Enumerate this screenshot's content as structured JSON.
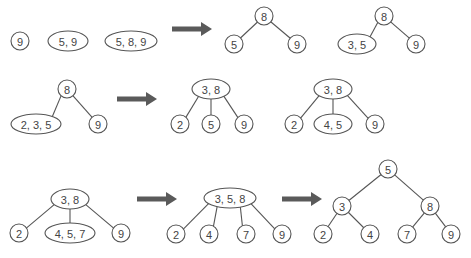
{
  "diagram": {
    "colors": {
      "stroke": "#555555",
      "text": "#444444",
      "arrow": "#5a5a5a",
      "background": "#ffffff"
    },
    "nodes": [
      {
        "id": "r1_a",
        "label": "9",
        "shape": "circle",
        "cx": 20,
        "cy": 41,
        "rx": 9,
        "ry": 9
      },
      {
        "id": "r1_b",
        "label": "5, 9",
        "shape": "ellipse",
        "cx": 68,
        "cy": 41,
        "rx": 20,
        "ry": 10
      },
      {
        "id": "r1_c",
        "label": "5, 8, 9",
        "shape": "ellipse",
        "cx": 131,
        "cy": 41,
        "rx": 26,
        "ry": 10
      },
      {
        "id": "r1_t1_root",
        "label": "8",
        "shape": "circle",
        "cx": 264,
        "cy": 16,
        "rx": 9,
        "ry": 9
      },
      {
        "id": "r1_t1_l",
        "label": "5",
        "shape": "circle",
        "cx": 234,
        "cy": 44,
        "rx": 9,
        "ry": 9
      },
      {
        "id": "r1_t1_r",
        "label": "9",
        "shape": "circle",
        "cx": 297,
        "cy": 44,
        "rx": 9,
        "ry": 9
      },
      {
        "id": "r1_t2_root",
        "label": "8",
        "shape": "circle",
        "cx": 384,
        "cy": 16,
        "rx": 9,
        "ry": 9
      },
      {
        "id": "r1_t2_l",
        "label": "3, 5",
        "shape": "ellipse",
        "cx": 357,
        "cy": 44,
        "rx": 19,
        "ry": 10
      },
      {
        "id": "r1_t2_r",
        "label": "9",
        "shape": "circle",
        "cx": 416,
        "cy": 44,
        "rx": 9,
        "ry": 9
      },
      {
        "id": "r2_t1_root",
        "label": "8",
        "shape": "circle",
        "cx": 67,
        "cy": 89,
        "rx": 9,
        "ry": 9
      },
      {
        "id": "r2_t1_l",
        "label": "2, 3, 5",
        "shape": "ellipse",
        "cx": 36,
        "cy": 124,
        "rx": 25,
        "ry": 10
      },
      {
        "id": "r2_t1_r",
        "label": "9",
        "shape": "circle",
        "cx": 98,
        "cy": 124,
        "rx": 9,
        "ry": 9
      },
      {
        "id": "r2_t2_root",
        "label": "3, 8",
        "shape": "ellipse",
        "cx": 211,
        "cy": 89,
        "rx": 19,
        "ry": 10
      },
      {
        "id": "r2_t2_a",
        "label": "2",
        "shape": "circle",
        "cx": 180,
        "cy": 124,
        "rx": 9,
        "ry": 9
      },
      {
        "id": "r2_t2_b",
        "label": "5",
        "shape": "circle",
        "cx": 211,
        "cy": 124,
        "rx": 9,
        "ry": 9
      },
      {
        "id": "r2_t2_c",
        "label": "9",
        "shape": "circle",
        "cx": 244,
        "cy": 124,
        "rx": 9,
        "ry": 9
      },
      {
        "id": "r2_t3_root",
        "label": "3, 8",
        "shape": "ellipse",
        "cx": 333,
        "cy": 89,
        "rx": 19,
        "ry": 10
      },
      {
        "id": "r2_t3_a",
        "label": "2",
        "shape": "circle",
        "cx": 294,
        "cy": 124,
        "rx": 9,
        "ry": 9
      },
      {
        "id": "r2_t3_b",
        "label": "4, 5",
        "shape": "ellipse",
        "cx": 333,
        "cy": 124,
        "rx": 19,
        "ry": 10
      },
      {
        "id": "r2_t3_c",
        "label": "9",
        "shape": "circle",
        "cx": 375,
        "cy": 124,
        "rx": 9,
        "ry": 9
      },
      {
        "id": "r3_t1_root",
        "label": "3, 8",
        "shape": "ellipse",
        "cx": 70,
        "cy": 199,
        "rx": 19,
        "ry": 10
      },
      {
        "id": "r3_t1_a",
        "label": "2",
        "shape": "circle",
        "cx": 19,
        "cy": 233,
        "rx": 9,
        "ry": 9
      },
      {
        "id": "r3_t1_b",
        "label": "4, 5, 7",
        "shape": "ellipse",
        "cx": 70,
        "cy": 233,
        "rx": 25,
        "ry": 10
      },
      {
        "id": "r3_t1_c",
        "label": "9",
        "shape": "circle",
        "cx": 121,
        "cy": 233,
        "rx": 9,
        "ry": 9
      },
      {
        "id": "r3_t2_root",
        "label": "3, 5, 8",
        "shape": "ellipse",
        "cx": 230,
        "cy": 198,
        "rx": 26,
        "ry": 10
      },
      {
        "id": "r3_t2_a",
        "label": "2",
        "shape": "circle",
        "cx": 176,
        "cy": 234,
        "rx": 9,
        "ry": 9
      },
      {
        "id": "r3_t2_b",
        "label": "4",
        "shape": "circle",
        "cx": 209,
        "cy": 234,
        "rx": 9,
        "ry": 9
      },
      {
        "id": "r3_t2_c",
        "label": "7",
        "shape": "circle",
        "cx": 246,
        "cy": 234,
        "rx": 9,
        "ry": 9
      },
      {
        "id": "r3_t2_d",
        "label": "9",
        "shape": "circle",
        "cx": 282,
        "cy": 234,
        "rx": 9,
        "ry": 9
      },
      {
        "id": "r3_t3_root",
        "label": "5",
        "shape": "circle",
        "cx": 388,
        "cy": 169,
        "rx": 9,
        "ry": 9
      },
      {
        "id": "r3_t3_l",
        "label": "3",
        "shape": "circle",
        "cx": 342,
        "cy": 206,
        "rx": 9,
        "ry": 9
      },
      {
        "id": "r3_t3_r",
        "label": "8",
        "shape": "circle",
        "cx": 430,
        "cy": 206,
        "rx": 9,
        "ry": 9
      },
      {
        "id": "r3_t3_ll",
        "label": "2",
        "shape": "circle",
        "cx": 323,
        "cy": 234,
        "rx": 9,
        "ry": 9
      },
      {
        "id": "r3_t3_lr",
        "label": "4",
        "shape": "circle",
        "cx": 370,
        "cy": 234,
        "rx": 9,
        "ry": 9
      },
      {
        "id": "r3_t3_rl",
        "label": "7",
        "shape": "circle",
        "cx": 407,
        "cy": 234,
        "rx": 9,
        "ry": 9
      },
      {
        "id": "r3_t3_rr",
        "label": "9",
        "shape": "circle",
        "cx": 451,
        "cy": 234,
        "rx": 9,
        "ry": 9
      }
    ],
    "edges": [
      [
        "r1_t1_root",
        "r1_t1_l"
      ],
      [
        "r1_t1_root",
        "r1_t1_r"
      ],
      [
        "r1_t2_root",
        "r1_t2_l"
      ],
      [
        "r1_t2_root",
        "r1_t2_r"
      ],
      [
        "r2_t1_root",
        "r2_t1_l"
      ],
      [
        "r2_t1_root",
        "r2_t1_r"
      ],
      [
        "r2_t2_root",
        "r2_t2_a"
      ],
      [
        "r2_t2_root",
        "r2_t2_b"
      ],
      [
        "r2_t2_root",
        "r2_t2_c"
      ],
      [
        "r2_t3_root",
        "r2_t3_a"
      ],
      [
        "r2_t3_root",
        "r2_t3_b"
      ],
      [
        "r2_t3_root",
        "r2_t3_c"
      ],
      [
        "r3_t1_root",
        "r3_t1_a"
      ],
      [
        "r3_t1_root",
        "r3_t1_b"
      ],
      [
        "r3_t1_root",
        "r3_t1_c"
      ],
      [
        "r3_t2_root",
        "r3_t2_a"
      ],
      [
        "r3_t2_root",
        "r3_t2_b"
      ],
      [
        "r3_t2_root",
        "r3_t2_c"
      ],
      [
        "r3_t2_root",
        "r3_t2_d"
      ],
      [
        "r3_t3_root",
        "r3_t3_l"
      ],
      [
        "r3_t3_root",
        "r3_t3_r"
      ],
      [
        "r3_t3_l",
        "r3_t3_ll"
      ],
      [
        "r3_t3_l",
        "r3_t3_lr"
      ],
      [
        "r3_t3_r",
        "r3_t3_rl"
      ],
      [
        "r3_t3_r",
        "r3_t3_rr"
      ]
    ],
    "arrows": [
      {
        "id": "arrow-1",
        "x": 172,
        "y": 29,
        "length": 40
      },
      {
        "id": "arrow-2",
        "x": 117,
        "y": 99,
        "length": 40
      },
      {
        "id": "arrow-3",
        "x": 137,
        "y": 199,
        "length": 40
      },
      {
        "id": "arrow-4",
        "x": 282,
        "y": 199,
        "length": 40
      }
    ]
  }
}
